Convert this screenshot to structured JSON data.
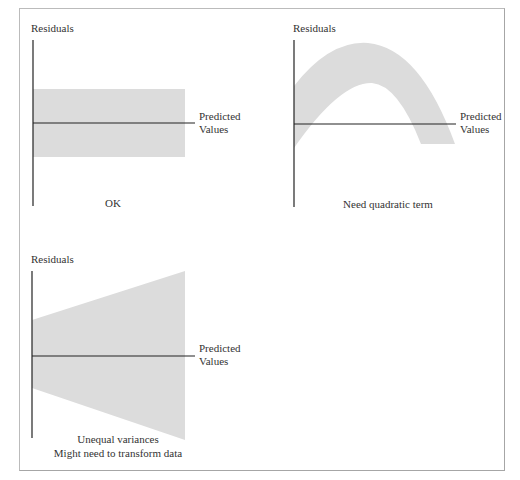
{
  "colors": {
    "band": "#dcdcdc",
    "axis": "#222222",
    "frame": "#a6a6a6",
    "text": "#333333"
  },
  "panels": [
    {
      "id": "ok",
      "y_label": "Residuals",
      "x_label_line1": "Predicted",
      "x_label_line2": "Values",
      "caption_line1": "OK",
      "pattern": "constant-band"
    },
    {
      "id": "quadratic",
      "y_label": "Residuals",
      "x_label_line1": "Predicted",
      "x_label_line2": "Values",
      "caption_line1": "Need quadratic term",
      "pattern": "arch-band"
    },
    {
      "id": "unequal-variance",
      "y_label": "Residuals",
      "x_label_line1": "Predicted",
      "x_label_line2": "Values",
      "caption_line1": "Unequal variances",
      "caption_line2": "Might need to transform data",
      "pattern": "funnel-wedge"
    }
  ]
}
